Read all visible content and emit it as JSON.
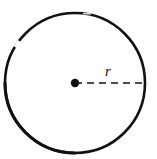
{
  "figure": {
    "kind": "geometry-diagram",
    "background_color": "#ffffff",
    "stroke_color": "#111111",
    "canvas": {
      "width": 157,
      "height": 159
    },
    "circle": {
      "center_x": 75,
      "center_y": 83,
      "radius": 70,
      "stroke_width": 2.6,
      "fill": "none",
      "has_stroke_break": true,
      "break_hint": "small white gap in outline at upper-left"
    },
    "center_dot": {
      "center_x": 75,
      "center_y": 83,
      "radius": 4.2,
      "fill": "#111111"
    },
    "radius_line": {
      "from_x": 75,
      "from_y": 83,
      "to_x": 145,
      "to_y": 83,
      "stroke_width": 1.3,
      "dash_pattern": "7 5",
      "style": "dashed"
    },
    "radius_label": {
      "text": "r",
      "x": 105,
      "y": 64,
      "font_size": 15,
      "italic": true
    }
  }
}
